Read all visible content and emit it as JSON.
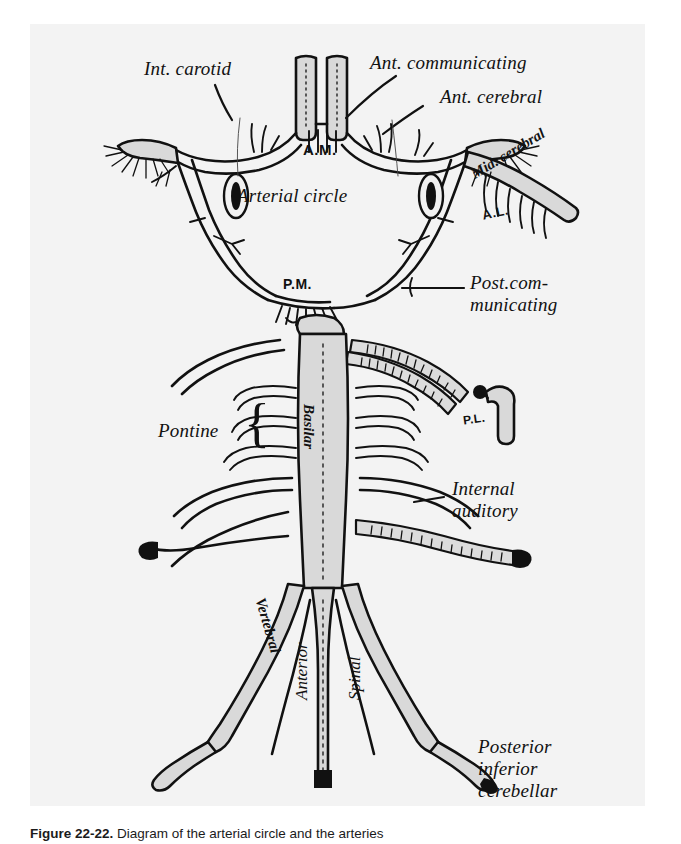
{
  "page": {
    "background": "#ffffff",
    "plate_background": "#f3f3f3",
    "ink_color": "#111111",
    "vessel_fill": "#d9d9d9"
  },
  "figure": {
    "type": "anatomical-line-drawing"
  },
  "labels": {
    "int_carotid": "Int. carotid",
    "ant_communicating": "Ant. communicating",
    "ant_cerebral": "Ant. cerebral",
    "mid_cerebral": "Mid. cerebral",
    "arterial_circle": "Arterial circle",
    "post_communicating_line1": "Post.com-",
    "post_communicating_line2": "municating",
    "pontine": "Pontine",
    "basilar": "Basilar",
    "vertebral": "Vertebral",
    "anterior": "Anterior",
    "spinal": "Spinal",
    "internal_line1": "Internal",
    "internal_line2": "auditory",
    "posterior_line1": "Posterior",
    "posterior_line2": "inferior",
    "posterior_line3": "cerebellar",
    "abbr_am": "A.M.",
    "abbr_pm": "P.M.",
    "abbr_al": "A.L.",
    "abbr_pl": "P.L."
  },
  "caption": {
    "figure_number": "Figure 22-22.",
    "text": "Diagram of the arterial circle and the arteries"
  }
}
